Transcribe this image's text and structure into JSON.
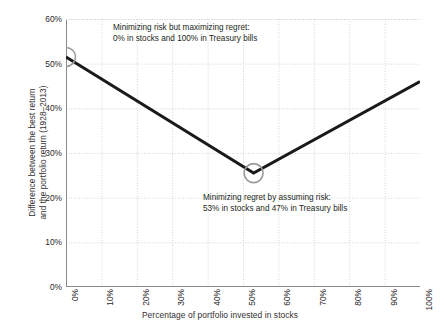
{
  "chart_data": {
    "type": "line",
    "title": "",
    "xlabel": "Percentage of portfolio invested in stocks",
    "ylabel_line1": "Difference between the best return",
    "ylabel_line2": "and the portfolio return (1928–2013)",
    "xlim": [
      0,
      100
    ],
    "ylim": [
      0,
      60
    ],
    "x_ticks": [
      "0%",
      "10%",
      "20%",
      "30%",
      "40%",
      "50%",
      "60%",
      "70%",
      "80%",
      "90%",
      "100%"
    ],
    "x_tick_values": [
      0,
      10,
      20,
      30,
      40,
      50,
      60,
      70,
      80,
      90,
      100
    ],
    "y_ticks": [
      "0%",
      "10%",
      "20%",
      "30%",
      "40%",
      "50%",
      "60%"
    ],
    "y_tick_values": [
      0,
      10,
      20,
      30,
      40,
      50,
      60
    ],
    "grid": true,
    "legend": "none",
    "series": [
      {
        "name": "Difference between best return and portfolio return",
        "x": [
          0,
          53,
          100
        ],
        "values": [
          51.5,
          25.5,
          46.0
        ],
        "color": "#1a1a1a",
        "line_width": 3
      }
    ],
    "markers": [
      {
        "name": "minimum-risk-point",
        "x": 0,
        "y": 51.5,
        "shape": "circle-outline",
        "color": "#9a9a9a"
      },
      {
        "name": "minimum-regret-point",
        "x": 53,
        "y": 25.5,
        "shape": "circle-outline",
        "color": "#9a9a9a"
      }
    ],
    "annotations": [
      {
        "name": "annotation-minimizing-risk",
        "line1": "Minimizing risk but maximizing regret:",
        "line2": "0% in stocks and 100% in Treasury bills",
        "anchor_x": 0,
        "anchor_y": 51.5
      },
      {
        "name": "annotation-minimizing-regret",
        "line1": "Minimizing regret by assuming risk:",
        "line2": "53% in stocks and 47% in Treasury bills",
        "anchor_x": 53,
        "anchor_y": 25.5
      }
    ],
    "colors": {
      "line": "#1a1a1a",
      "grid": "#d4d4d4",
      "axis": "#8a8a8a",
      "text": "#231f20",
      "marker_outline": "#9a9a9a",
      "background": "#ffffff"
    }
  }
}
